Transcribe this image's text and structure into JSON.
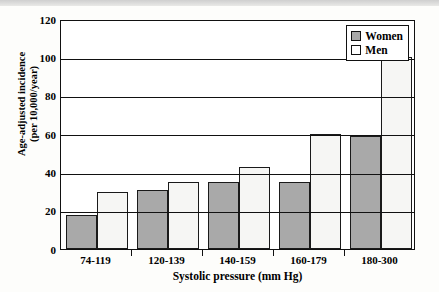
{
  "chart_data": {
    "type": "bar",
    "title": "",
    "subtitle": "",
    "xlabel": "Systolic pressure (mm Hg)",
    "ylabel": "Age-adjusted incidence\n(per 10,000/year)",
    "ylabel_line1": "Age-adjusted incidence",
    "ylabel_line2": "(per 10,000/year)",
    "categories": [
      "74-119",
      "120-139",
      "140-159",
      "160-179",
      "180-300"
    ],
    "series": [
      {
        "name": "Women",
        "color": "#a9a9a9",
        "values": [
          18,
          31,
          35,
          35,
          59
        ]
      },
      {
        "name": "Men",
        "color": "#f6f6f4",
        "values": [
          30,
          35,
          43,
          60,
          100
        ]
      }
    ],
    "ylim": [
      0,
      120
    ],
    "yticks": [
      0,
      20,
      40,
      60,
      80,
      100,
      120
    ],
    "ytick_labels": [
      "0",
      "20",
      "40",
      "60",
      "80",
      "100",
      "120"
    ],
    "grid": true,
    "grid_axis": "y",
    "legend_position": "top-right",
    "legend_entries": [
      "Women",
      "Men"
    ]
  }
}
